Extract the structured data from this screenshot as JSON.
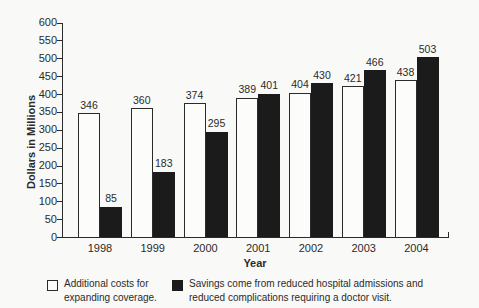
{
  "figure": {
    "background": "#f9f9f7",
    "ink_color": "#2b2b2b",
    "bar_white_color": "#fcfcfa",
    "bar_black_color": "#1b1b1b"
  },
  "chart_data": {
    "type": "bar",
    "title": "",
    "xlabel": "Year",
    "ylabel": "Dollars in Millions",
    "categories": [
      "1998",
      "1999",
      "2000",
      "2001",
      "2002",
      "2003",
      "2004"
    ],
    "series": [
      {
        "name": "Additional costs for expanding coverage.",
        "color": "#fcfcfa",
        "values": [
          346,
          360,
          374,
          389,
          404,
          421,
          438
        ]
      },
      {
        "name": "Savings come from reduced hospital admissions and reduced complications requiring a doctor visit.",
        "color": "#1b1b1b",
        "values": [
          85,
          183,
          295,
          401,
          430,
          466,
          503
        ]
      }
    ],
    "ylim": [
      0,
      600
    ],
    "yticks": [
      0,
      50,
      100,
      150,
      200,
      250,
      300,
      350,
      400,
      450,
      500,
      550,
      600
    ],
    "grid": false,
    "bar_value_labels": true,
    "legend_position": "bottom"
  },
  "legend": {
    "items": [
      {
        "swatch": "white-square",
        "lines": [
          "Additional costs for",
          "expanding coverage."
        ]
      },
      {
        "swatch": "black-square",
        "lines": [
          "Savings come from reduced hospital admissions and",
          "reduced complications requiring a doctor visit."
        ]
      }
    ]
  }
}
